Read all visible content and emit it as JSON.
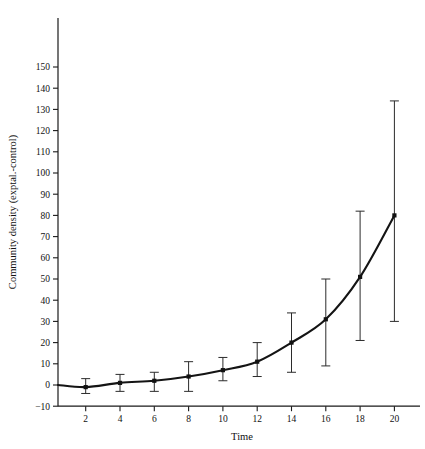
{
  "chart_data": {
    "type": "line",
    "title": "",
    "xlabel": "Time",
    "ylabel": "Community density (exptal.-control)",
    "xlim": [
      0,
      21.5
    ],
    "ylim": [
      -10,
      158
    ],
    "grid": false,
    "legend": null,
    "x": [
      2,
      4,
      6,
      8,
      10,
      12,
      14,
      16,
      18,
      20
    ],
    "values": [
      -1,
      1,
      2,
      4,
      7,
      11,
      20,
      31,
      51,
      80
    ],
    "error_low": [
      -4,
      -3,
      -3,
      -3,
      2,
      4,
      6,
      9,
      21,
      30
    ],
    "error_high": [
      3,
      5,
      6,
      11,
      13,
      20,
      34,
      50,
      82,
      134
    ],
    "xticks": [
      2,
      4,
      6,
      8,
      10,
      12,
      14,
      16,
      18,
      20
    ],
    "xticklabels": [
      "2",
      "4",
      "6",
      "8",
      "10",
      "12",
      "14",
      "16",
      "18",
      "20"
    ],
    "yticks": [
      -10,
      0,
      10,
      20,
      30,
      40,
      50,
      60,
      70,
      80,
      90,
      100,
      110,
      120,
      130,
      140,
      150
    ],
    "yticklabels": [
      "−10",
      "0",
      "10",
      "20",
      "30",
      "40",
      "50",
      "60",
      "70",
      "80",
      "90",
      "100",
      "110",
      "120",
      "130",
      "140",
      "150"
    ],
    "series_name": "community density difference",
    "marker": "filled-square",
    "line_color": "#141414",
    "errorbar_color": "#2b2b2b"
  },
  "axes": {
    "x_title": "Time",
    "y_title": "Community density (exptal.-control)"
  }
}
